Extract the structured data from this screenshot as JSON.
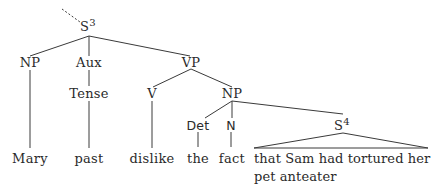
{
  "tree": {
    "root": {
      "label": "S",
      "superscript": "3"
    },
    "level1": {
      "np": "NP",
      "aux": "Aux",
      "vp": "VP"
    },
    "level2": {
      "tense": "Tense",
      "v": "V",
      "np": "NP"
    },
    "level3": {
      "det": "Det",
      "n": "N",
      "s": "S",
      "s_superscript": "4"
    },
    "leaves": {
      "mary": "Mary",
      "past": "past",
      "dislike": "dislike",
      "the": "the",
      "fact": "fact",
      "clause_line1": "that Sam had tortured her",
      "clause_line2": "pet anteater"
    }
  },
  "colors": {
    "line": "#3a3a3a",
    "text": "#2a2a2a",
    "background": "#ffffff"
  }
}
